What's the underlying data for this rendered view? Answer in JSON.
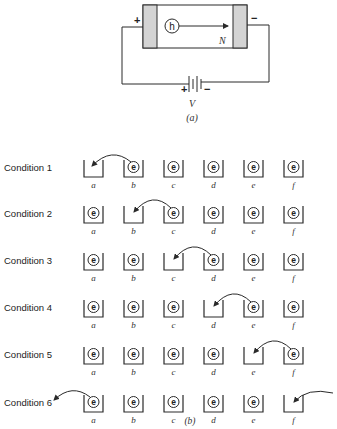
{
  "part_a": {
    "carrier_symbol": "h",
    "region_label": "N",
    "left_terminal": "+",
    "right_terminal": "−",
    "battery_plus": "+",
    "battery_minus": "−",
    "voltage_label": "V",
    "caption": "(a)",
    "colors": {
      "plate": "#d4d4d4",
      "line": "#2a2a2a"
    }
  },
  "part_b": {
    "caption": "(b)",
    "bucket_labels": [
      "a",
      "b",
      "c",
      "d",
      "e",
      "f"
    ],
    "electron_symbol": "e",
    "conditions": [
      {
        "label": "Condition 1",
        "occupied": [
          false,
          true,
          true,
          true,
          true,
          true
        ],
        "arrow": {
          "from": "outside-left",
          "to": "a",
          "type": "in-from-b"
        }
      },
      {
        "label": "Condition 2",
        "occupied": [
          true,
          false,
          true,
          true,
          true,
          true
        ],
        "arrow": {
          "from": "c",
          "to": "b"
        }
      },
      {
        "label": "Condition 3",
        "occupied": [
          true,
          true,
          false,
          true,
          true,
          true
        ],
        "arrow": {
          "from": "d",
          "to": "c"
        }
      },
      {
        "label": "Condition 4",
        "occupied": [
          true,
          true,
          true,
          false,
          true,
          true
        ],
        "arrow": {
          "from": "e",
          "to": "d"
        }
      },
      {
        "label": "Condition 5",
        "occupied": [
          true,
          true,
          true,
          true,
          false,
          true
        ],
        "arrow": {
          "from": "f",
          "to": "e"
        }
      },
      {
        "label": "Condition 6",
        "occupied": [
          true,
          true,
          true,
          true,
          true,
          false
        ],
        "arrow": {
          "from": "a",
          "to": "outside-left",
          "incoming": "f"
        }
      }
    ]
  }
}
